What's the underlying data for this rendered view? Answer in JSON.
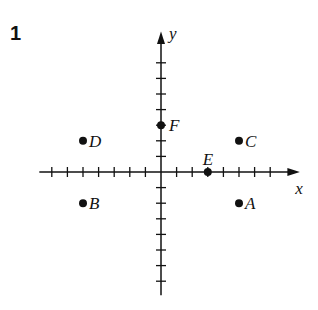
{
  "problem_number": "1",
  "axes": {
    "x_label": "x",
    "y_label": "y",
    "x_range": [
      -7,
      7
    ],
    "y_range": [
      -7,
      7
    ],
    "tick_step": 1
  },
  "points": [
    {
      "name": "A",
      "x": 5,
      "y": -2
    },
    {
      "name": "B",
      "x": -5,
      "y": -2
    },
    {
      "name": "C",
      "x": 5,
      "y": 2
    },
    {
      "name": "D",
      "x": -5,
      "y": 2
    },
    {
      "name": "E",
      "x": 3,
      "y": 0
    },
    {
      "name": "F",
      "x": 0,
      "y": 3
    }
  ],
  "colors": {
    "ink": "#111111",
    "background": "#ffffff"
  }
}
